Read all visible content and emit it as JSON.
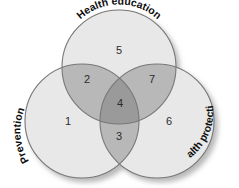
{
  "diagram": {
    "type": "venn",
    "set_count": 3,
    "background_color": "#ffffff",
    "stroke_color": "#777777",
    "shadow_color": "#bdbdbd",
    "fill_single": "#e8e8e8",
    "fill_pair": "#b8b8b8",
    "fill_triple": "#9a9a9a",
    "text_color": "#2b2b2b",
    "label_color": "#101010"
  },
  "sets": [
    {
      "id": "health-education",
      "label": "Health education",
      "position": "top",
      "cx": 119,
      "cy": 67,
      "r": 57
    },
    {
      "id": "prevention",
      "label": "Prevention",
      "position": "bottom-left",
      "cx": 82,
      "cy": 121,
      "r": 57
    },
    {
      "id": "health-protection",
      "label": "Health protection",
      "position": "bottom-right",
      "cx": 157,
      "cy": 121,
      "r": 57
    }
  ],
  "regions": [
    {
      "id": "region-1",
      "number": "1",
      "sets": [
        "prevention"
      ],
      "shade": "single",
      "x": 68,
      "y": 121
    },
    {
      "id": "region-2",
      "number": "2",
      "sets": [
        "health-education",
        "prevention"
      ],
      "shade": "pair",
      "x": 87,
      "y": 79
    },
    {
      "id": "region-3",
      "number": "3",
      "sets": [
        "prevention",
        "health-protection"
      ],
      "shade": "pair",
      "x": 119,
      "y": 136
    },
    {
      "id": "region-4",
      "number": "4",
      "sets": [
        "health-education",
        "prevention",
        "health-protection"
      ],
      "shade": "triple",
      "x": 120,
      "y": 103
    },
    {
      "id": "region-5",
      "number": "5",
      "sets": [
        "health-education"
      ],
      "shade": "single",
      "x": 119,
      "y": 50
    },
    {
      "id": "region-6",
      "number": "6",
      "sets": [
        "health-protection"
      ],
      "shade": "single",
      "x": 169,
      "y": 121
    },
    {
      "id": "region-7",
      "number": "7",
      "sets": [
        "health-education",
        "health-protection"
      ],
      "shade": "pair",
      "x": 152,
      "y": 79
    }
  ]
}
